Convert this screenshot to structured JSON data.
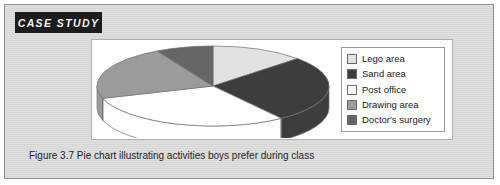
{
  "banner": {
    "label": "CASE STUDY"
  },
  "caption": {
    "text": "Figure 3.7 Pie chart illustrating activities boys prefer during class"
  },
  "legend": {
    "items": [
      {
        "label": "Lego area",
        "color": "#e2e2e2"
      },
      {
        "label": "Sand area",
        "color": "#3d3d3d"
      },
      {
        "label": "Post office",
        "color": "#ffffff"
      },
      {
        "label": "Drawing area",
        "color": "#9b9b9b"
      },
      {
        "label": "Doctor's surgery",
        "color": "#666666"
      }
    ]
  },
  "colors": {
    "figure_background": "#d8d8d8",
    "figure_border": "#8e8e8e",
    "banner_background": "#1c1c1c",
    "banner_text": "#f2f2f2",
    "chart_background": "#ffffff",
    "outline": "#707070"
  },
  "chart_data": {
    "type": "pie",
    "title": "",
    "subtitle": "",
    "xlabel": "",
    "ylabel": "",
    "legend_position": "right",
    "grid": false,
    "three_d": true,
    "start_angle_deg": 0,
    "direction": "clockwise",
    "categories": [
      "Lego area",
      "Sand area",
      "Post office",
      "Drawing area",
      "Doctor's surgery"
    ],
    "values": [
      13,
      27,
      30,
      22,
      8
    ],
    "units": "percent",
    "series": [
      {
        "name": "Activities boys prefer during class",
        "values": [
          13,
          27,
          30,
          22,
          8
        ]
      }
    ],
    "slice_colors": [
      "#e2e2e2",
      "#3d3d3d",
      "#ffffff",
      "#9b9b9b",
      "#666666"
    ],
    "annotations": []
  }
}
